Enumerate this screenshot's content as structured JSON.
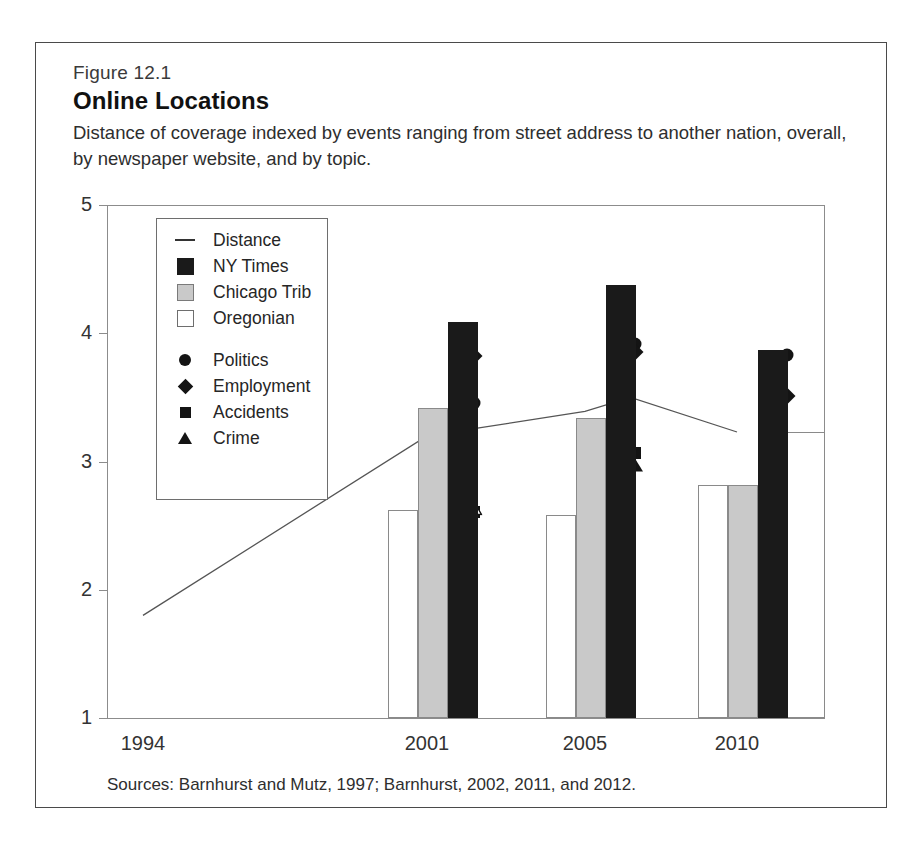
{
  "figure": {
    "number": "Figure 12.1",
    "title": "Online Locations",
    "subtitle": "Distance of coverage indexed by events ranging from street address to another nation, overall, by newspaper website, and by topic.",
    "sources": "Sources: Barnhurst and Mutz, 1997; Barnhurst, 2002, 2011, and 2012."
  },
  "legend": {
    "position": "inside-top-left",
    "items": [
      {
        "label": "Distance",
        "key": "line",
        "icon": "line-key-icon"
      },
      {
        "label": "NY Times",
        "key": "black-bar",
        "icon": "black-square-icon"
      },
      {
        "label": "Chicago Trib",
        "key": "gray-bar",
        "icon": "gray-square-icon"
      },
      {
        "label": "Oregonian",
        "key": "white-bar",
        "icon": "white-square-icon"
      },
      {
        "label": "Politics",
        "key": "circle",
        "icon": "circle-marker-icon"
      },
      {
        "label": "Employment",
        "key": "diamond",
        "icon": "diamond-marker-icon"
      },
      {
        "label": "Accidents",
        "key": "square",
        "icon": "square-marker-icon"
      },
      {
        "label": "Crime",
        "key": "triangle",
        "icon": "triangle-marker-icon"
      }
    ]
  },
  "chart_data": {
    "type": "bar",
    "title": "Online Locations",
    "subtitle": "Distance of coverage indexed by events ranging from street address to another nation, overall, by newspaper website, and by topic.",
    "xlabel": "",
    "ylabel": "",
    "categories": [
      "1994",
      "2001",
      "2005",
      "2010"
    ],
    "xticklabels": [
      "1994",
      "2001",
      "2005",
      "2010"
    ],
    "yticklabels": [
      "1",
      "2",
      "3",
      "4",
      "5"
    ],
    "ylim": [
      1,
      5
    ],
    "grid": false,
    "series": [
      {
        "name": "NY Times",
        "type": "bar",
        "color": "#1a1a1a",
        "values": [
          null,
          4.09,
          4.38,
          3.87
        ]
      },
      {
        "name": "Chicago Trib",
        "type": "bar",
        "color": "#c9c9c9",
        "values": [
          null,
          3.42,
          3.34,
          2.82
        ]
      },
      {
        "name": "Oregonian",
        "type": "bar",
        "color": "#ffffff",
        "values": [
          null,
          2.62,
          2.58,
          2.82
        ]
      },
      {
        "name": "Distance",
        "type": "line",
        "color": "#555555",
        "x": [
          1994,
          2001,
          2005,
          2006.5,
          2010
        ],
        "values": [
          1.8,
          3.2,
          3.39,
          3.5,
          3.23
        ]
      },
      {
        "name": "Politics",
        "type": "scatter",
        "marker": "circle",
        "values": [
          null,
          3.46,
          3.92,
          3.83
        ]
      },
      {
        "name": "Employment",
        "type": "scatter",
        "marker": "diamond",
        "values": [
          null,
          3.82,
          3.85,
          3.51
        ]
      },
      {
        "name": "Accidents",
        "type": "scatter",
        "marker": "square",
        "values": [
          null,
          2.61,
          3.07,
          2.62
        ]
      },
      {
        "name": "Crime",
        "type": "scatter",
        "marker": "triangle",
        "values": [
          null,
          2.64,
          2.97,
          2.72
        ]
      }
    ],
    "notes": "Sources: Barnhurst and Mutz, 1997; Barnhurst, 2002, 2011, and 2012."
  }
}
